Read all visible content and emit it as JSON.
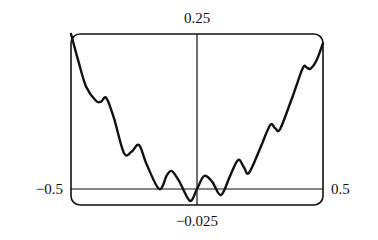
{
  "chart_data": {
    "type": "line",
    "title": "",
    "xlabel": "",
    "ylabel": "",
    "xlim": [
      -0.5,
      0.5
    ],
    "ylim": [
      -0.025,
      0.25
    ],
    "grid": false,
    "legend": null,
    "axis_labels": {
      "y_top": "0.25",
      "y_bottom": "−0.025",
      "x_left": "−0.5",
      "x_right": "0.5"
    },
    "series": [
      {
        "name": "f(x)",
        "x": [
          -0.5,
          -0.47,
          -0.44,
          -0.4,
          -0.38,
          -0.36,
          -0.33,
          -0.29,
          -0.26,
          -0.23,
          -0.2,
          -0.15,
          -0.12,
          -0.1,
          -0.07,
          -0.028,
          0.0,
          0.028,
          0.06,
          0.095,
          0.13,
          0.163,
          0.186,
          0.206,
          0.25,
          0.29,
          0.31,
          0.33,
          0.38,
          0.42,
          0.435,
          0.45,
          0.475,
          0.5
        ],
        "y": [
          0.25,
          0.205,
          0.165,
          0.142,
          0.141,
          0.147,
          0.115,
          0.058,
          0.06,
          0.071,
          0.04,
          0.0,
          0.022,
          0.029,
          0.012,
          -0.019,
          0.0,
          0.021,
          0.012,
          -0.01,
          0.02,
          0.047,
          0.035,
          0.026,
          0.065,
          0.103,
          0.098,
          0.097,
          0.15,
          0.195,
          0.196,
          0.194,
          0.208,
          0.235
        ]
      }
    ]
  },
  "colors": {
    "line": "#111111",
    "frame": "#111111",
    "background": "#ffffff"
  }
}
